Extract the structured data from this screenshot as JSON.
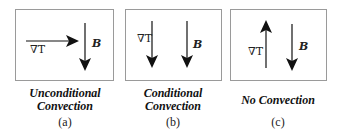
{
  "panels": [
    {
      "id": "a",
      "caption_line1": "Unconditional",
      "caption_line2": "Convection",
      "sublabel": "(a)",
      "gradT_label": "∇T",
      "gradT_direction": "right",
      "B_label": "B",
      "B_direction": "down"
    },
    {
      "id": "b",
      "caption_line1": "Conditional",
      "caption_line2": "Convection",
      "sublabel": "(b)",
      "gradT_label": "∇T",
      "gradT_direction": "down",
      "B_label": "B",
      "B_direction": "down"
    },
    {
      "id": "c",
      "caption_line1": "No Convection",
      "caption_line2": "",
      "sublabel": "(c)",
      "gradT_label": "∇T",
      "gradT_direction": "up",
      "B_label": "B",
      "B_direction": "down"
    }
  ],
  "colors": {
    "arrow": "#111111",
    "border": "#9a9a9a"
  }
}
